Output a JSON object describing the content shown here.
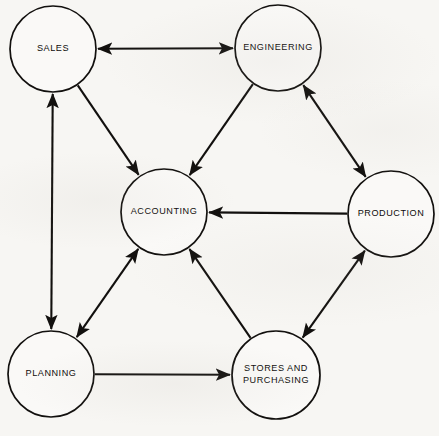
{
  "diagram": {
    "background_color": "#f7f6f3",
    "stroke_color": "#12100e",
    "node_fill_color": "#faf9f7",
    "nodes": [
      {
        "id": "sales",
        "label": "SALES",
        "cx": 53,
        "cy": 49,
        "r": 43,
        "lines": [
          "SALES"
        ]
      },
      {
        "id": "engineering",
        "label": "ENGINEERING",
        "cx": 278,
        "cy": 48,
        "r": 43,
        "lines": [
          "ENGINEERING"
        ]
      },
      {
        "id": "accounting",
        "label": "ACCOUNTING",
        "cx": 164,
        "cy": 212,
        "r": 43,
        "lines": [
          "ACCOUNTING"
        ]
      },
      {
        "id": "production",
        "label": "PRODUCTION",
        "cx": 391,
        "cy": 214,
        "r": 43,
        "lines": [
          "PRODUCTION"
        ]
      },
      {
        "id": "planning",
        "label": "PLANNING",
        "cx": 51,
        "cy": 374,
        "r": 43,
        "lines": [
          "PLANNING"
        ]
      },
      {
        "id": "stores",
        "label": "STORES AND PURCHASING",
        "cx": 276,
        "cy": 375,
        "r": 44,
        "lines": [
          "STORES AND",
          "PURCHASING"
        ]
      }
    ],
    "edges": [
      {
        "id": "sales-engineering",
        "from": "sales",
        "to": "engineering",
        "direction": "both"
      },
      {
        "id": "sales-planning",
        "from": "sales",
        "to": "planning",
        "direction": "both"
      },
      {
        "id": "sales-accounting",
        "from": "sales",
        "to": "accounting",
        "direction": "forward"
      },
      {
        "id": "engineering-accounting",
        "from": "engineering",
        "to": "accounting",
        "direction": "forward"
      },
      {
        "id": "engineering-production",
        "from": "engineering",
        "to": "production",
        "direction": "both"
      },
      {
        "id": "production-accounting",
        "from": "production",
        "to": "accounting",
        "direction": "forward"
      },
      {
        "id": "production-stores",
        "from": "production",
        "to": "stores",
        "direction": "both"
      },
      {
        "id": "planning-accounting",
        "from": "planning",
        "to": "accounting",
        "direction": "both"
      },
      {
        "id": "stores-accounting",
        "from": "stores",
        "to": "accounting",
        "direction": "forward"
      },
      {
        "id": "planning-stores",
        "from": "planning",
        "to": "stores",
        "direction": "forward"
      }
    ]
  },
  "labels": {
    "sales": "SALES",
    "engineering": "ENGINEERING",
    "accounting": "ACCOUNTING",
    "production": "PRODUCTION",
    "planning": "PLANNING",
    "stores_line1": "STORES AND",
    "stores_line2": "PURCHASING"
  }
}
